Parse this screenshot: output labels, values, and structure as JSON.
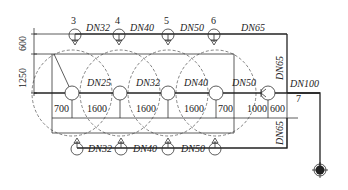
{
  "diagram": {
    "type": "sprinkler-pipe-layout",
    "top_branch": {
      "sprinkler_numbers": [
        "3",
        "4",
        "5",
        "6"
      ],
      "pipe_labels": [
        "DN32",
        "DN40",
        "DN50",
        "DN65"
      ]
    },
    "middle_branch": {
      "pipe_labels": [
        "DN25",
        "DN32",
        "DN40",
        "DN50"
      ],
      "node_label": "7",
      "main_pipe_label": "DN100"
    },
    "bottom_branch": {
      "pipe_labels": [
        "DN32",
        "DN40",
        "DN50"
      ]
    },
    "riser_labels": {
      "upper": "DN65",
      "lower": "DN65"
    },
    "vertical_dimensions": [
      "600",
      "1250"
    ],
    "horizontal_dimensions": [
      "700",
      "1600",
      "1600",
      "1600",
      "700",
      "1000",
      "600"
    ]
  }
}
